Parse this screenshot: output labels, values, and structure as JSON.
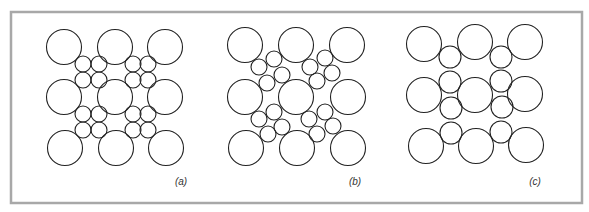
{
  "figure": {
    "frame": {
      "x": 11,
      "y": 12,
      "width": 571,
      "height": 191,
      "stroke": "#a8a8a8",
      "stroke_width": 2.5
    },
    "circle_stroke": "#222222",
    "panels": [
      {
        "id": "a",
        "label": "(a)",
        "label_pos": [
          181,
          185
        ],
        "large_radius": 17.5,
        "small_radius": 8,
        "large_circles": [
          [
            64,
            47
          ],
          [
            115,
            47
          ],
          [
            165,
            47
          ],
          [
            64,
            97
          ],
          [
            115,
            97
          ],
          [
            165,
            97
          ],
          [
            65,
            148
          ],
          [
            116,
            148
          ],
          [
            166,
            148
          ]
        ],
        "small_circles": [
          [
            83,
            64
          ],
          [
            99,
            64
          ],
          [
            83,
            80
          ],
          [
            99,
            80
          ],
          [
            133,
            64
          ],
          [
            148,
            64
          ],
          [
            133,
            80
          ],
          [
            148,
            80
          ],
          [
            83,
            114
          ],
          [
            99,
            114
          ],
          [
            83,
            130
          ],
          [
            99,
            130
          ],
          [
            133,
            114
          ],
          [
            148,
            114
          ],
          [
            133,
            130
          ],
          [
            148,
            130
          ]
        ]
      },
      {
        "id": "b",
        "label": "(b)",
        "label_pos": [
          355,
          185
        ],
        "large_radius": 17.5,
        "small_radius": 8,
        "large_circles": [
          [
            245,
            45
          ],
          [
            296,
            45
          ],
          [
            347,
            45
          ],
          [
            245,
            97
          ],
          [
            296,
            97
          ],
          [
            348,
            97
          ],
          [
            246,
            148
          ],
          [
            297,
            148
          ],
          [
            348,
            148
          ]
        ],
        "small_circles": [
          [
            259,
            67
          ],
          [
            274,
            59
          ],
          [
            282,
            75
          ],
          [
            267,
            83
          ],
          [
            310,
            67
          ],
          [
            325,
            58
          ],
          [
            332,
            73
          ],
          [
            317,
            81
          ],
          [
            259,
            119
          ],
          [
            274,
            112
          ],
          [
            282,
            127
          ],
          [
            268,
            134
          ],
          [
            309,
            119
          ],
          [
            325,
            112
          ],
          [
            333,
            126
          ],
          [
            317,
            134
          ]
        ]
      },
      {
        "id": "c",
        "label": "(c)",
        "label_pos": [
          535,
          185
        ],
        "large_radius": 17.5,
        "small_radius": 11,
        "large_circles": [
          [
            424,
            44
          ],
          [
            475,
            42
          ],
          [
            525,
            42
          ],
          [
            424,
            95
          ],
          [
            475,
            95
          ],
          [
            525,
            94
          ],
          [
            426,
            146
          ],
          [
            476,
            146
          ],
          [
            526,
            145
          ]
        ],
        "small_circles": [
          [
            450,
            57
          ],
          [
            450,
            82
          ],
          [
            451,
            108
          ],
          [
            451,
            133
          ],
          [
            501,
            57
          ],
          [
            501,
            81
          ],
          [
            502,
            107
          ],
          [
            501,
            132
          ]
        ]
      }
    ]
  }
}
